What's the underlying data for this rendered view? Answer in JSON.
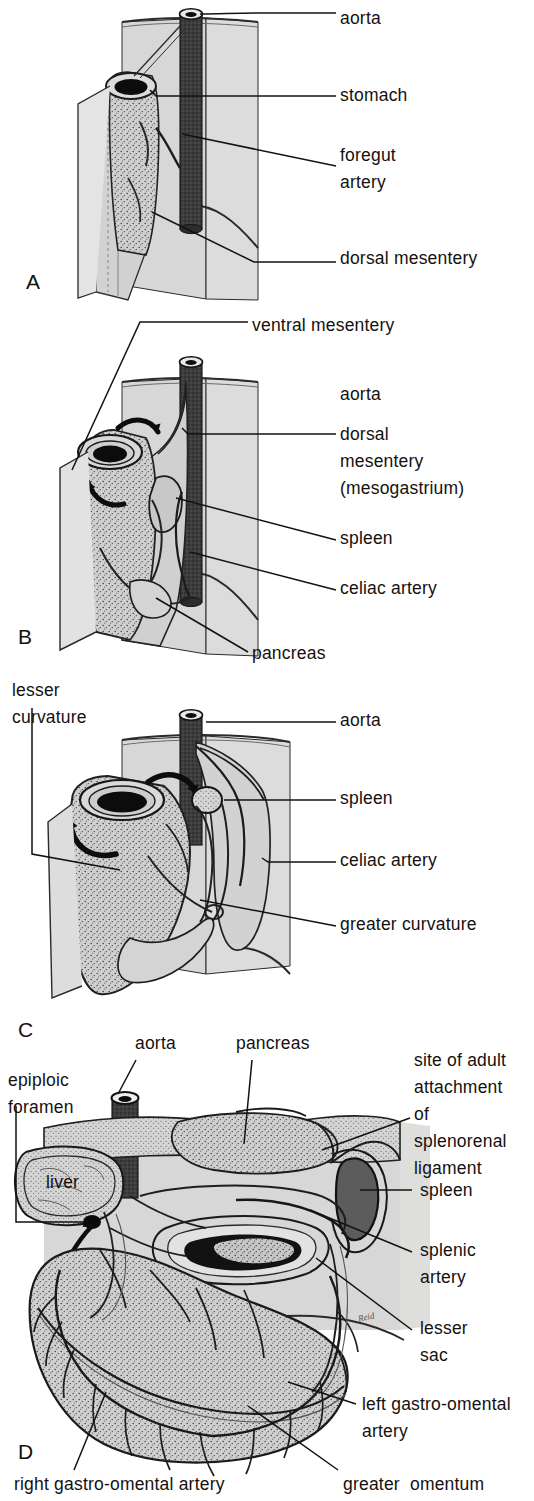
{
  "figure": {
    "width": 534,
    "height": 1501,
    "background_color": "#ffffff",
    "ink_color": "#15110f",
    "wall_fill": "#d6d6d6",
    "organ_fill": "#c9c9c9",
    "organ_fill_light": "#d9d9d9",
    "vessel_dark": "#3a3a3a",
    "vessel_black": "#111111"
  },
  "panels": [
    {
      "id": "A",
      "letter": "A",
      "letter_x": 26,
      "letter_y": 270,
      "labels": [
        {
          "key": "aorta",
          "text": "aorta",
          "x": 340,
          "y": 8,
          "lines": [
            "aorta"
          ]
        },
        {
          "key": "stomach",
          "text": "stomach",
          "x": 340,
          "y": 85,
          "lines": [
            "stomach"
          ]
        },
        {
          "key": "foregut_artery",
          "text": "foregut artery",
          "x": 340,
          "y": 145,
          "lines": [
            "foregut",
            "artery"
          ]
        },
        {
          "key": "dorsal_mesentery",
          "text": "dorsal mesentery",
          "x": 340,
          "y": 248,
          "lines": [
            "dorsal mesentery"
          ]
        }
      ]
    },
    {
      "id": "B",
      "letter": "B",
      "letter_x": 18,
      "letter_y": 625,
      "labels": [
        {
          "key": "ventral_mesentery",
          "text": "ventral mesentery",
          "x": 252,
          "y": 315,
          "lines": [
            "ventral mesentery"
          ]
        },
        {
          "key": "aorta",
          "text": "aorta",
          "x": 340,
          "y": 384,
          "lines": [
            "aorta"
          ]
        },
        {
          "key": "dorsal_mesentery",
          "text": "dorsal mesentery (mesogastrium)",
          "x": 340,
          "y": 424,
          "lines": [
            "dorsal",
            "mesentery",
            "(mesogastrium)"
          ]
        },
        {
          "key": "spleen",
          "text": "spleen",
          "x": 340,
          "y": 528,
          "lines": [
            "spleen"
          ]
        },
        {
          "key": "celiac_artery",
          "text": "celiac artery",
          "x": 340,
          "y": 578,
          "lines": [
            "celiac artery"
          ]
        },
        {
          "key": "pancreas",
          "text": "pancreas",
          "x": 252,
          "y": 643,
          "lines": [
            "pancreas"
          ]
        }
      ]
    },
    {
      "id": "C",
      "letter": "C",
      "letter_x": 18,
      "letter_y": 1018,
      "labels": [
        {
          "key": "lesser_curvature",
          "text": "lesser curvature",
          "x": 12,
          "y": 680,
          "lines": [
            "lesser",
            "curvature"
          ]
        },
        {
          "key": "aorta",
          "text": "aorta",
          "x": 340,
          "y": 718,
          "lines": [
            "aorta"
          ]
        },
        {
          "key": "spleen",
          "text": "spleen",
          "x": 340,
          "y": 793,
          "lines": [
            "spleen"
          ]
        },
        {
          "key": "celiac_artery",
          "text": "celiac artery",
          "x": 340,
          "y": 852,
          "lines": [
            "celiac artery"
          ]
        },
        {
          "key": "greater_curvature",
          "text": "greater curvature",
          "x": 340,
          "y": 916,
          "lines": [
            "greater curvature"
          ]
        }
      ]
    },
    {
      "id": "D",
      "letter": "D",
      "letter_x": 18,
      "letter_y": 1448,
      "labels": [
        {
          "key": "aorta",
          "text": "aorta",
          "x": 135,
          "y": 1040,
          "lines": [
            "aorta"
          ]
        },
        {
          "key": "pancreas",
          "text": "pancreas",
          "x": 236,
          "y": 1040,
          "lines": [
            "pancreas"
          ]
        },
        {
          "key": "epiploic_foramen",
          "text": "epiploic foramen",
          "x": 8,
          "y": 1077,
          "lines": [
            "epiploic",
            "foramen"
          ]
        },
        {
          "key": "site_of_adult_attachment",
          "text": "site of adult attachment of splenorenal ligament",
          "x": 414,
          "y": 1057,
          "lines": [
            "site of adult",
            "attachment",
            "of",
            "splenorenal",
            "ligament"
          ]
        },
        {
          "key": "liver",
          "text": "liver",
          "x": 50,
          "y": 1178,
          "lines": [
            "liver"
          ]
        },
        {
          "key": "spleen",
          "text": "spleen",
          "x": 420,
          "y": 1190,
          "lines": [
            "spleen"
          ]
        },
        {
          "key": "splenic_artery",
          "text": "splenic artery",
          "x": 420,
          "y": 1250,
          "lines": [
            "splenic",
            "artery"
          ]
        },
        {
          "key": "lesser_sac",
          "text": "lesser sac",
          "x": 420,
          "y": 1326,
          "lines": [
            "lesser",
            "sac"
          ]
        },
        {
          "key": "left_gastro_omental_artery",
          "text": "left gastro-omental artery",
          "x": 362,
          "y": 1401,
          "lines": [
            "left gastro-omental",
            "artery"
          ]
        },
        {
          "key": "right_gastro_omental_artery",
          "text": "right gastro-omental artery",
          "x": 14,
          "y": 1476,
          "lines": [
            "right gastro-omental artery"
          ]
        },
        {
          "key": "greater_omentum",
          "text": "greater  omentum",
          "x": 343,
          "y": 1476,
          "lines": [
            "greater  omentum"
          ]
        }
      ],
      "signature": {
        "text": "Reid",
        "x": 358,
        "y": 1318
      }
    }
  ],
  "structures": {
    "A": [
      "body wall",
      "aorta",
      "stomach (tubular foregut)",
      "foregut artery",
      "dorsal mesentery",
      "ventral mesentery"
    ],
    "B": [
      "aorta",
      "stomach",
      "dorsal mesentery (mesogastrium)",
      "ventral mesentery",
      "spleen",
      "celiac artery",
      "pancreas"
    ],
    "C": [
      "aorta",
      "stomach",
      "spleen",
      "celiac artery",
      "lesser curvature",
      "greater curvature"
    ],
    "D": [
      "aorta",
      "liver",
      "pancreas",
      "spleen",
      "splenic artery",
      "lesser sac",
      "epiploic foramen",
      "greater omentum",
      "left gastro-omental artery",
      "right gastro-omental artery",
      "splenorenal ligament attachment site"
    ]
  }
}
